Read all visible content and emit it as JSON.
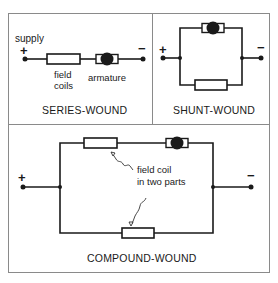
{
  "panels": {
    "series": {
      "title": "SERIES-WOUND",
      "supply_label": "supply",
      "plus": "+",
      "minus": "−",
      "field_label_line1": "field",
      "field_label_line2": "coils",
      "armature_label": "armature"
    },
    "shunt": {
      "title": "SHUNT-WOUND",
      "plus": "+",
      "minus": "−"
    },
    "compound": {
      "title": "COMPOUND-WOUND",
      "plus": "+",
      "minus": "−",
      "annotation_line1": "field coil",
      "annotation_line2": "in two parts"
    }
  },
  "colors": {
    "line": "#1a1a1a",
    "frame": "#7a7a7a",
    "background": "#ffffff"
  }
}
